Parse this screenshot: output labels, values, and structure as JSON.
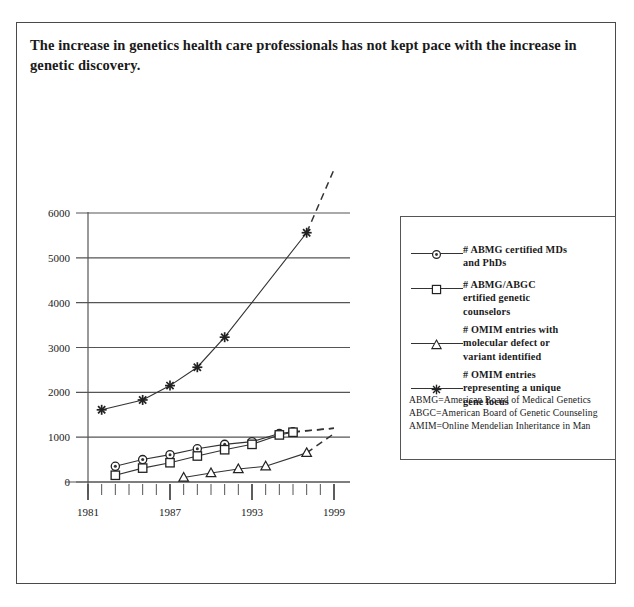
{
  "title": "The increase in genetics health care professionals has not kept pace with the increase in genetic discovery.",
  "legend": {
    "entries": [
      {
        "symbol": "circle",
        "label": "# ABMG certified MDs\nand PhDs"
      },
      {
        "symbol": "square",
        "label": "# ABMG/ABGC\nertified genetic\ncounselors"
      },
      {
        "symbol": "triangle",
        "label": "# OMIM entries with\nmolecular defect or\nvariant identified"
      },
      {
        "symbol": "star",
        "label": "# OMIM entries\nrepresenting a unique\ngene locus"
      }
    ],
    "footnotes": "ABMG=American Board of Medical Genetics\nABGC=American Board of Genetic Counseling\nAMIM=Online Mendelian Inheritance in Man"
  },
  "chart_data": {
    "type": "line",
    "title": "The increase in genetics health care professionals has not kept pace with the increase in genetic discovery.",
    "xlabel": "",
    "ylabel": "",
    "xlim": [
      1981,
      1999
    ],
    "ylim": [
      0,
      6000
    ],
    "yticks": [
      0,
      1000,
      2000,
      3000,
      4000,
      5000,
      6000
    ],
    "xticks": [
      1981,
      1987,
      1993,
      1999
    ],
    "xtick_labels": [
      "1981",
      "1987",
      "1993",
      "1999"
    ],
    "minor_xticks_every": 1,
    "grid": "horizontal",
    "legend_position": "right",
    "series": [
      {
        "name": "# ABMG certified MDs and PhDs",
        "symbol": "circle",
        "x": [
          1983,
          1985,
          1987,
          1989,
          1991,
          1993,
          1995,
          1996
        ],
        "values": [
          350,
          500,
          610,
          740,
          840,
          900,
          1080,
          1120
        ],
        "projection": {
          "x": [
            1996,
            1999
          ],
          "values": [
            1120,
            1200
          ],
          "style": "dashed"
        }
      },
      {
        "name": "# ABMG/ABGC ertified genetic counselors",
        "symbol": "square",
        "x": [
          1983,
          1985,
          1987,
          1989,
          1991,
          1993,
          1995,
          1996
        ],
        "values": [
          150,
          310,
          430,
          580,
          720,
          840,
          1050,
          1110
        ],
        "projection": {
          "x": [
            1996,
            1999
          ],
          "values": [
            1110,
            1200
          ],
          "style": "dashed"
        }
      },
      {
        "name": "# OMIM entries with molecular defect or variant identified",
        "symbol": "triangle",
        "x": [
          1988,
          1990,
          1992,
          1994,
          1997
        ],
        "values": [
          100,
          200,
          290,
          350,
          650
        ],
        "projection": {
          "x": [
            1997,
            1999
          ],
          "values": [
            650,
            1080
          ],
          "style": "dashed"
        }
      },
      {
        "name": "# OMIM entries representing a unique gene locus",
        "symbol": "star",
        "x": [
          1982,
          1985,
          1987,
          1989,
          1991,
          1997
        ],
        "values": [
          1610,
          1830,
          2150,
          2560,
          3230,
          5560
        ],
        "projection": {
          "x": [
            1997,
            1999
          ],
          "values": [
            5560,
            6970
          ],
          "style": "dashed"
        }
      }
    ]
  },
  "colors": {
    "ink": "#1a1a1a",
    "line": "#333333",
    "grid": "#555555",
    "frame": "#4a4a4a",
    "background": "#ffffff"
  }
}
